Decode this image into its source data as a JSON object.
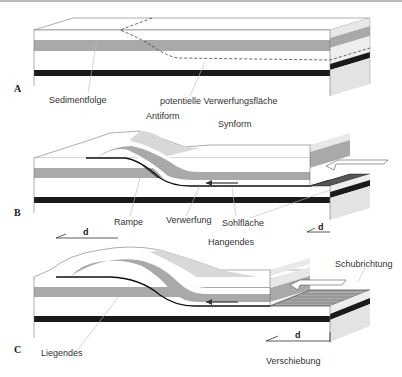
{
  "figure": {
    "panels": [
      {
        "id": "A",
        "label": "A",
        "annotations": {
          "sediment": "Sedimentfolge",
          "potential_fault": "potentielle Verwerfungsfläche"
        }
      },
      {
        "id": "B",
        "label": "B",
        "annotations": {
          "antiform": "Antiform",
          "synform": "Synform",
          "ramp": "Rampe",
          "fault": "Verwerfung",
          "detachment": "Sohlfläche",
          "displacement": "d",
          "displacement_left": "d"
        }
      },
      {
        "id": "C",
        "label": "C",
        "annotations": {
          "hanging_wall": "Hangendes",
          "thrust_direction": "Schubrichtung",
          "footwall": "Liegendes",
          "displacement": "d",
          "displacement_label": "Verschiebung"
        }
      }
    ]
  },
  "colors": {
    "layer_white": "#ffffff",
    "layer_gray": "#a9a9a9",
    "layer_black": "#1a1a1a",
    "side_face": "#e6e6e6",
    "top_shade": "#d9d9d9",
    "detachment_dark": "#555555",
    "outline": "#666666"
  }
}
